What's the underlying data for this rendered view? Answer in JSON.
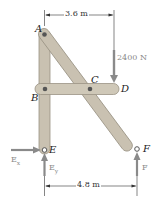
{
  "diagram": {
    "type": "frame-statics",
    "points": {
      "A": "A",
      "B": "B",
      "C": "C",
      "D": "D",
      "E": "E",
      "F": "F"
    },
    "dimensions": {
      "top": "3.6 m",
      "bottom": "4.8 m"
    },
    "forces": {
      "load": "2400 N",
      "Ex": "E",
      "Ex_sub": "x",
      "Ey": "E",
      "Ey_sub": "y",
      "F": "F"
    },
    "colors": {
      "member_fill": "#c9c1b1",
      "member_edge": "#9a9384",
      "arrow": "#8a8a8a",
      "line": "#333333"
    }
  }
}
